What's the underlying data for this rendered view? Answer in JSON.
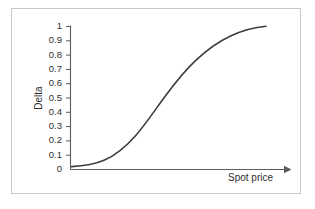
{
  "figure": {
    "frame_color": "#c9c9c9",
    "background": "#ffffff"
  },
  "chart_data": {
    "type": "line",
    "title": "",
    "subtitle": "",
    "xlabel": "Spot price",
    "ylabel": "Delta",
    "legend": [],
    "grid": false,
    "curve_color": "#3d3d3d",
    "axis_color": "#5c5c5c",
    "x_axis": {
      "has_arrow": true,
      "tick_labels": [],
      "range_label": ""
    },
    "y_axis": {
      "ticks": [
        1,
        0.9,
        0.8,
        0.7,
        0.6,
        0.5,
        0.4,
        0.3,
        0.2,
        0.1,
        0
      ],
      "tick_labels": [
        "1",
        "0.9",
        "0.8",
        "0.7",
        "0.6",
        "0.5",
        "0.4",
        "0.3",
        "0.2",
        "0.1",
        "0"
      ],
      "ylim": [
        0,
        1
      ]
    },
    "series": [
      {
        "name": "Delta",
        "description": "Call option delta as a function of spot price (sigmoid / cumulative normal shape)",
        "x": [
          0,
          0.05,
          0.1,
          0.15,
          0.2,
          0.25,
          0.3,
          0.35,
          0.4,
          0.45,
          0.5,
          0.55,
          0.6,
          0.65,
          0.7,
          0.75,
          0.8,
          0.85,
          0.9,
          0.95,
          1.0
        ],
        "values": [
          0.02,
          0.025,
          0.035,
          0.05,
          0.075,
          0.11,
          0.155,
          0.215,
          0.285,
          0.365,
          0.45,
          0.535,
          0.615,
          0.69,
          0.755,
          0.81,
          0.86,
          0.895,
          0.925,
          0.945,
          0.952
        ]
      }
    ]
  },
  "labels": {
    "y_title": "Delta",
    "x_title": "Spot price"
  }
}
